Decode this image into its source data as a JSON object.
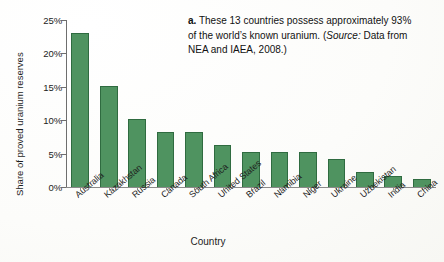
{
  "chart_data": {
    "type": "bar",
    "title": "",
    "xlabel": "Country",
    "ylabel": "Share of proved uranium reserves",
    "categories": [
      "Australia",
      "Kazakhstan",
      "Russia",
      "Canada",
      "South Africa",
      "United States",
      "Brazil",
      "Namibia",
      "Niger",
      "Ukraine",
      "Uzbekistan",
      "India",
      "China"
    ],
    "values": [
      23.0,
      15.1,
      10.2,
      8.3,
      8.3,
      6.3,
      5.3,
      5.3,
      5.3,
      4.2,
      2.3,
      1.7,
      1.2
    ],
    "ylim": [
      0,
      25
    ],
    "ytick_values": [
      0,
      5,
      10,
      15,
      20,
      25
    ],
    "ytick_labels": [
      "0%",
      "5%",
      "10%",
      "15%",
      "20%",
      "25%"
    ],
    "value_unit": "%",
    "grid": false,
    "legend": "none",
    "bar_color": "#4f9360",
    "bar_edge_color": "#2f6b40"
  },
  "annotation": {
    "label": "a.",
    "text_part1": " These 13 countries possess approximately 93% of the world’s known uranium. (",
    "source_word": "Source:",
    "text_part2": " Data from NEA and IAEA, 2008.)"
  }
}
